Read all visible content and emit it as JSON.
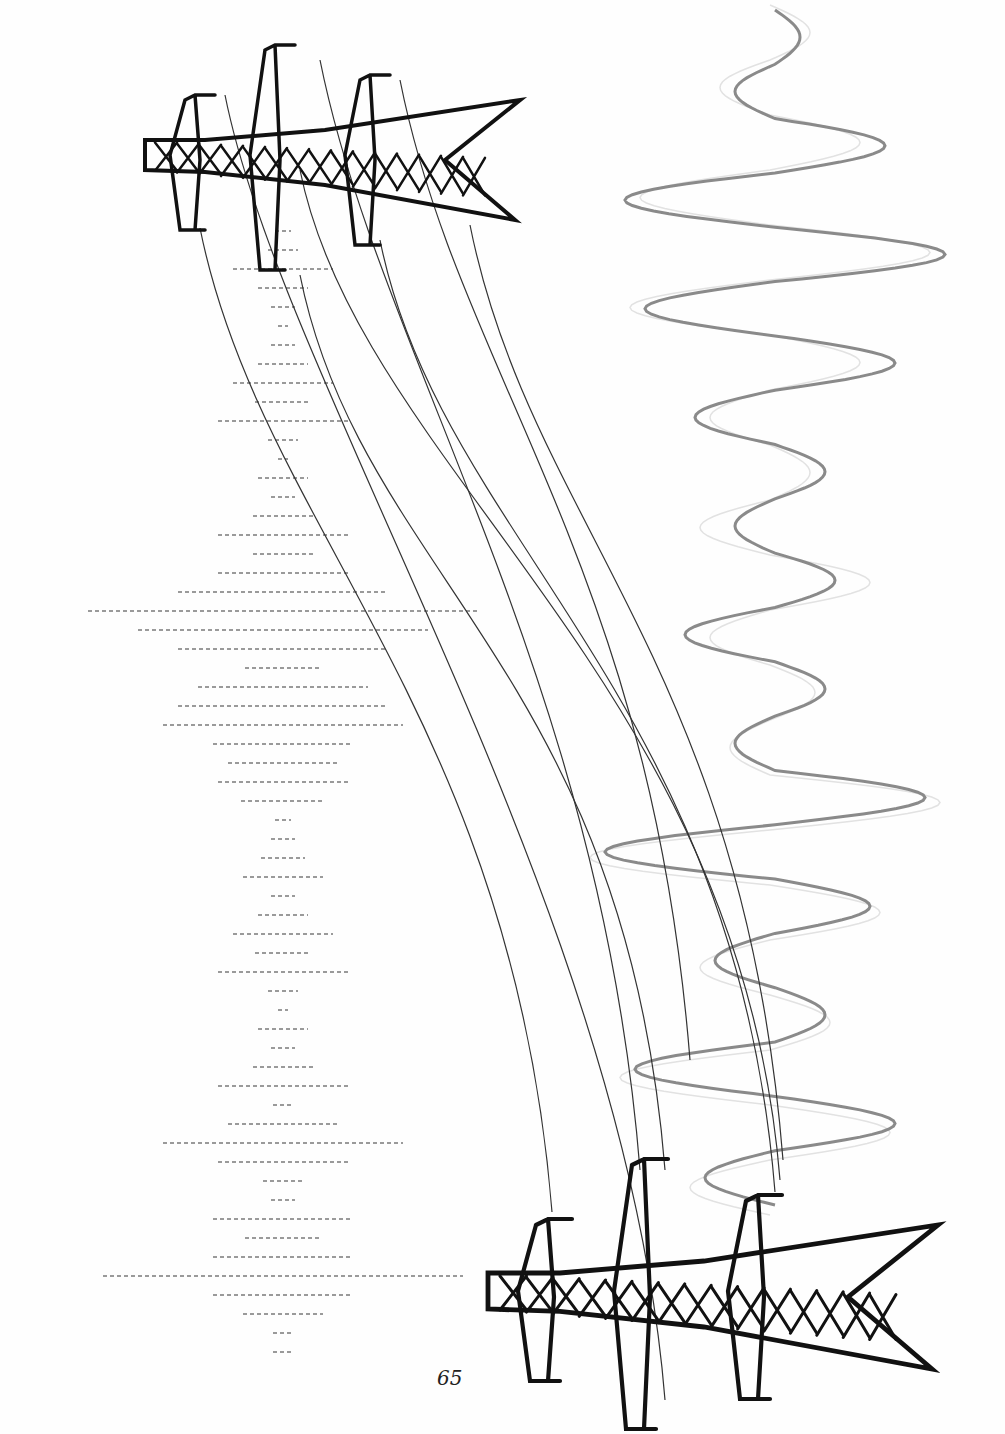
{
  "page": {
    "number": "65"
  },
  "colors": {
    "ink": "#111111",
    "wire": "#333333",
    "wave": "#8a8a8a",
    "wave_faint": "#e2e2e2",
    "dash": "#9a9a9a"
  },
  "dash_rows": {
    "center_x": 283,
    "start_y": 231,
    "spacing": 19,
    "half_widths": [
      8,
      15,
      50,
      25,
      12,
      5,
      12,
      25,
      50,
      28,
      65,
      15,
      5,
      25,
      12,
      30,
      65,
      30,
      65,
      105,
      195,
      145,
      105,
      38,
      85,
      105,
      120,
      70,
      55,
      65,
      42,
      8,
      12,
      22,
      40,
      12,
      25,
      50,
      28,
      65,
      15,
      5,
      25,
      12,
      30,
      65,
      10,
      55,
      120,
      65,
      20,
      12,
      70,
      38,
      70,
      180,
      70,
      40,
      10,
      10
    ]
  },
  "towers": [
    {
      "name": "top-tower",
      "x": 145,
      "y": 50,
      "scale": 1.0,
      "flip": false
    },
    {
      "name": "bottom-tower",
      "x": 488,
      "y": 1165,
      "scale": 1.2,
      "flip": false
    }
  ]
}
